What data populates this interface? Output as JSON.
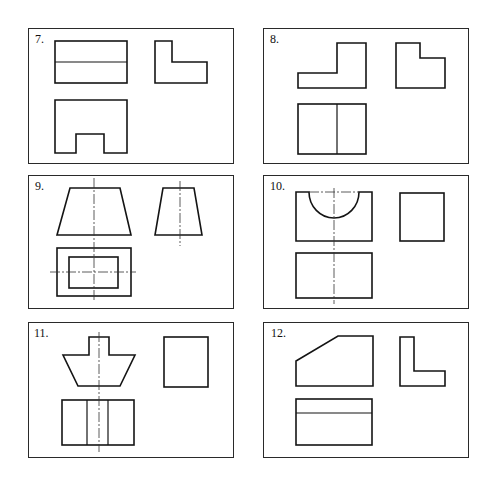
{
  "figure": {
    "colors": {
      "line": "#141414",
      "frame": "#2a2a2a",
      "background": "#ffffff"
    },
    "panels": [
      {
        "id": "p7",
        "label": "7."
      },
      {
        "id": "p8",
        "label": "8."
      },
      {
        "id": "p9",
        "label": "9."
      },
      {
        "id": "p10",
        "label": "10."
      },
      {
        "id": "p11",
        "label": "11."
      },
      {
        "id": "p12",
        "label": "12."
      }
    ]
  }
}
